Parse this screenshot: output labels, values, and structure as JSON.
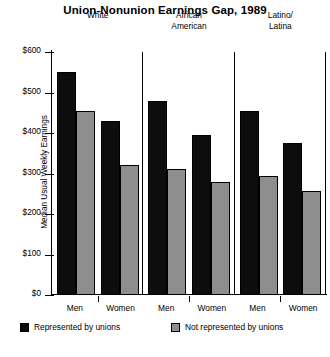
{
  "chart_data": {
    "type": "bar",
    "title": "Union-Nonunion Earnings Gap, 1989",
    "xlabel": "",
    "ylabel": "Median Usual Weekly Earnings",
    "ylim": [
      0,
      600
    ],
    "ytick_labels": [
      "$600",
      "$500",
      "$400",
      "$300",
      "$200",
      "$100",
      "$0"
    ],
    "ytick_values": [
      600,
      500,
      400,
      300,
      200,
      100,
      0
    ],
    "grid": false,
    "legend_position": "bottom",
    "groups": [
      "White",
      "African\nAmerican",
      "Latino/\nLatina"
    ],
    "categories": [
      "Men",
      "Women",
      "Men",
      "Women",
      "Men",
      "Women"
    ],
    "series": [
      {
        "name": "Represented by unions",
        "color": "#0d0d0d",
        "values": [
          550,
          430,
          480,
          395,
          455,
          375
        ]
      },
      {
        "name": "Not represented by unions",
        "color": "#8e8e8e",
        "values": [
          455,
          320,
          310,
          280,
          295,
          258
        ]
      }
    ]
  },
  "legend": {
    "union_label": "Represented by unions",
    "nonunion_label": "Not represented by unions"
  }
}
